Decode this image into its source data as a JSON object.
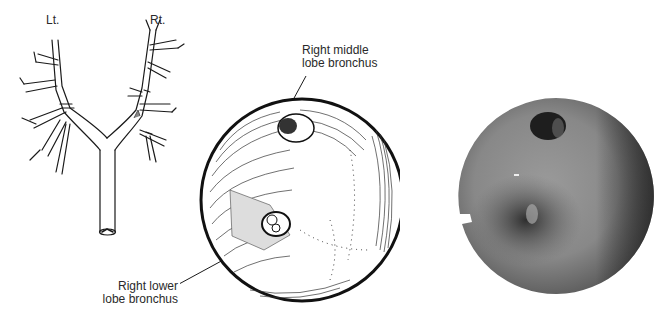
{
  "figure": {
    "tree_diagram": {
      "left_label": "Lt.",
      "right_label": "Rt."
    },
    "endoscopic_drawing": {
      "annotations": [
        {
          "line1": "Right middle",
          "line2": "lobe bronchus"
        },
        {
          "line1": "Right lower",
          "line2": "lobe bronchus"
        }
      ]
    },
    "endoscopic_photo": {
      "description": "Grayscale bronchoscopic photograph"
    }
  },
  "colors": {
    "ink": "#1a1a1a",
    "background": "#ffffff",
    "photo_mid": "#8a8a8a",
    "photo_dark": "#3a3a3a"
  }
}
